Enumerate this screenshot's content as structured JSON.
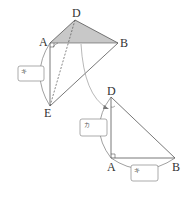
{
  "diagram": {
    "top_figure": {
      "points": {
        "D": {
          "label": "D",
          "x": 75,
          "y": 20
        },
        "A": {
          "label": "A",
          "x": 50,
          "y": 43
        },
        "B": {
          "label": "B",
          "x": 118,
          "y": 43
        },
        "E": {
          "label": "E",
          "x": 50,
          "y": 106
        }
      },
      "shaded_face": "ADB",
      "shade_color": "#c8c8c8",
      "answer_box": {
        "label": "キ"
      }
    },
    "bottom_figure": {
      "points": {
        "D": {
          "label": "D",
          "x": 111,
          "y": 97
        },
        "A": {
          "label": "A",
          "x": 111,
          "y": 158
        },
        "B": {
          "label": "B",
          "x": 175,
          "y": 158
        }
      },
      "answer_box_left": {
        "label": "カ"
      },
      "answer_box_bottom": {
        "label": "キ"
      }
    },
    "colors": {
      "line": "#555555",
      "arc": "#777777",
      "shade": "#c8c8c8"
    }
  }
}
